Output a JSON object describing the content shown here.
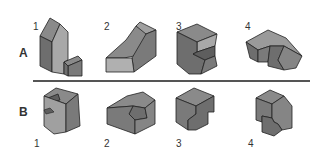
{
  "rows": [
    {
      "label": "A",
      "figures": [
        {
          "number": "1",
          "name": "stepped-house-block"
        },
        {
          "number": "2",
          "name": "notched-wedge-block"
        },
        {
          "number": "3",
          "name": "cutout-corner-block"
        },
        {
          "number": "4",
          "name": "grooved-ridge-block"
        }
      ]
    },
    {
      "label": "B",
      "figures": [
        {
          "number": "1",
          "name": "notched-cube-block"
        },
        {
          "number": "2",
          "name": "beveled-slot-block"
        },
        {
          "number": "3",
          "name": "stepped-cube-block"
        },
        {
          "number": "4",
          "name": "interlocked-cube-block"
        }
      ]
    }
  ],
  "colors": {
    "shape_fill_dark": "#6e6e6e",
    "shape_fill_mid": "#8a8a8a",
    "shape_fill_light": "#a8a8a8",
    "edge": "#222222",
    "divider": "#555555"
  }
}
